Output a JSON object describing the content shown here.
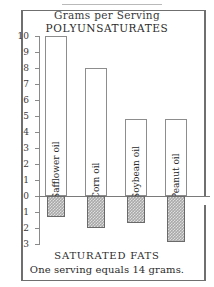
{
  "figure": {
    "heading_serving": "Grams per Serving",
    "heading_poly": "POLYUNSATURATES",
    "footer_saturated": "SATURATED FATS",
    "footer_note": "One serving equals 14 grams."
  },
  "chart_data": {
    "type": "bar",
    "title": "Grams per Serving",
    "subtitle": "POLYUNSATURATES",
    "footer": "SATURATED FATS",
    "note": "One serving equals 14 grams.",
    "xlabel": "",
    "ylabel": "Grams per Serving",
    "orientation": "vertical",
    "grid": false,
    "legend": "none",
    "axis_note": "Values above the zero line are polyunsaturates; values below the zero line are saturated fats, shown as positive magnitudes on a downward axis.",
    "ylim": [
      -3,
      10
    ],
    "yticks": [
      10,
      9,
      8,
      7,
      6,
      5,
      4,
      3,
      2,
      1,
      0,
      1,
      2,
      3
    ],
    "ytick_labels": [
      "10",
      "9",
      "8",
      "7",
      "6",
      "5",
      "4",
      "3",
      "2",
      "1",
      "0",
      "1",
      "2",
      "3"
    ],
    "categories": [
      "Safflower oil",
      "Corn oil",
      "Soybean oil",
      "Peanut oil"
    ],
    "series": [
      {
        "name": "POLYUNSATURATES",
        "values": [
          10.0,
          8.0,
          4.8,
          4.8
        ]
      },
      {
        "name": "SATURATED FATS",
        "values": [
          1.3,
          2.0,
          1.7,
          2.9
        ]
      }
    ]
  },
  "colors": {
    "ink": "#2b2b2b",
    "frame": "#6f6f6f",
    "axis": "#8a8a8a",
    "bar_outline": "#8d8d8d",
    "bar_positive_fill": "#ffffff",
    "bar_negative_fill": "#a9a9a9",
    "background": "#ffffff"
  }
}
